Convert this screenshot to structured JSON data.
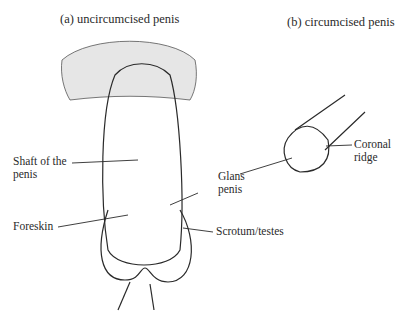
{
  "panels": {
    "a": {
      "title": "(a) uncircumcised penis",
      "labels": {
        "shaft_line1": "Shaft of the",
        "shaft_line2": "penis",
        "foreskin": "Foreskin",
        "glans_line1": "Glans",
        "glans_line2": "penis",
        "scrotum": "Scrotum/testes"
      }
    },
    "b": {
      "title": "(b) circumcised penis",
      "labels": {
        "coronal_line1": "Coronal",
        "coronal_line2": "ridge"
      }
    }
  },
  "colors": {
    "ink": "#2a2a2a",
    "background": "#ffffff"
  }
}
